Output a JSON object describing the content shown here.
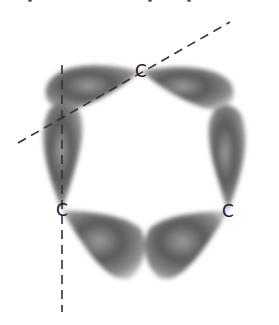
{
  "diagram": {
    "type": "orbital-overlap",
    "atoms": [
      {
        "label": "C",
        "x": 141,
        "y": 71
      },
      {
        "label": "C",
        "x": 62,
        "y": 210
      },
      {
        "label": "C",
        "x": 228,
        "y": 211
      }
    ],
    "axes": [
      {
        "style": "dashed",
        "x1": 62,
        "y1": 65,
        "x2": 62,
        "y2": 312
      },
      {
        "style": "dashed",
        "x1": 18,
        "y1": 143,
        "x2": 230,
        "y2": 22
      }
    ],
    "colors": {
      "lobe_dark": "#4a4a4a",
      "lobe_mid": "#8a8a8a",
      "lobe_light": "#b5b5b5",
      "line": "#333333",
      "label": "#1a1a1a"
    }
  }
}
